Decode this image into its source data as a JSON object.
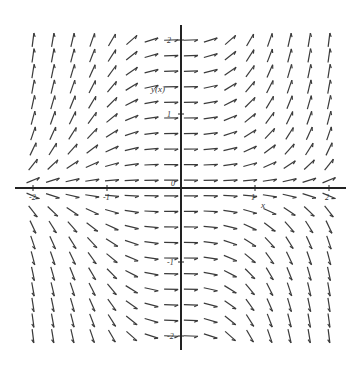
{
  "chart_data": {
    "type": "direction_field",
    "title": "",
    "equation_hint": "dy/dx = x^2 * y",
    "xlabel": "x",
    "ylabel": "y(x)",
    "xlim": [
      -2.1,
      2.1
    ],
    "ylim": [
      -2.1,
      2.1
    ],
    "x_ticks": [
      -2,
      -1,
      1,
      2
    ],
    "x_tick_labels": [
      "-2",
      "-1",
      "1",
      "2"
    ],
    "y_ticks": [
      -2,
      -1,
      1,
      2
    ],
    "y_tick_labels": [
      "-2",
      "-1",
      "1",
      "2"
    ],
    "origin_label": "0",
    "grid": false,
    "arrow_grid": {
      "cols": 16,
      "rows": 20,
      "x_start": -2.0,
      "x_end": 2.0,
      "y_start": -2.0,
      "y_end": 2.0
    },
    "colors": {
      "axis": "#222222",
      "arrow": "#3a3a3a"
    }
  },
  "layout": {
    "origin_px": [
      181,
      188
    ],
    "px_per_unit_x": 74,
    "px_per_unit_y": 74,
    "x_axis_px": [
      15,
      346
    ],
    "y_axis_px": [
      25,
      350
    ],
    "arrow_len_px": 14
  }
}
